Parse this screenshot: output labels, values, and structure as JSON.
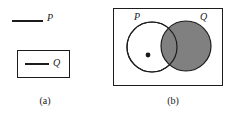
{
  "figure": {
    "panel_a": {
      "caption": "(a)",
      "outer_segment_label": "P",
      "inner_segment_label": "Q",
      "description": "A line segment labeled P drawn outside a rectangle, and a line segment labeled Q drawn inside a rectangle"
    },
    "panel_b": {
      "caption": "(b)",
      "left_circle_label": "P",
      "right_circle_label": "Q",
      "description": "Venn diagram: rectangle universe containing two overlapping circles, P unshaded with a point marked inside, Q shaded gray"
    },
    "colors": {
      "stroke": "#1c1c1c",
      "shaded_fill": "#808080",
      "unshaded_fill": "#ffffff",
      "background": "#ffffff",
      "point_fill": "#1a1a1a"
    }
  }
}
